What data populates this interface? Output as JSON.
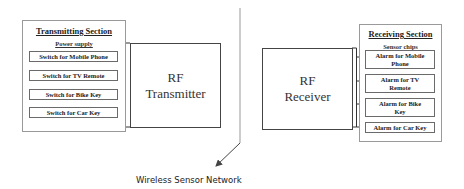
{
  "diagram": {
    "transmitting_section": {
      "title": "Transmitting Section",
      "subtitle": "Power supply",
      "items": [
        "Switch for Mobile Phone",
        "Switch for TV Remote",
        "Switch for Bike Key",
        "Switch for Car Key"
      ]
    },
    "rf_transmitter": {
      "line1": "RF",
      "line2": "Transmitter"
    },
    "rf_receiver": {
      "line1": "RF",
      "line2": "Receiver"
    },
    "receiving_section": {
      "title": "Receiving Section",
      "subtitle": "Sensor chips",
      "items": [
        "Alarm for Mobile Phone",
        "Alarm for TV Remote",
        "Alarm for Bike Key",
        "Alarm for Car Key"
      ]
    },
    "network_label": "Wireless Sensor Network"
  }
}
